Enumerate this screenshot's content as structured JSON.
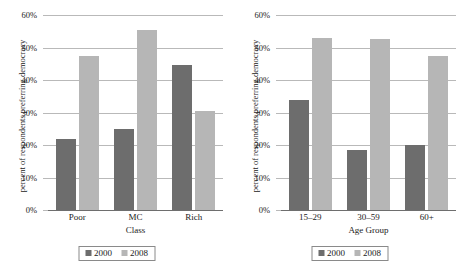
{
  "figure": {
    "clipped_header_text": "",
    "series_colors": {
      "s2000": "#6d6d6d",
      "s2008": "#b6b6b6"
    },
    "gridline_color": "#b9b9b9",
    "axis_color": "#6e6e6e"
  },
  "chart_data": [
    {
      "type": "bar",
      "title": "",
      "xlabel": "Class",
      "ylabel": "percent of respondents preferring democracy",
      "categories": [
        "Poor",
        "MC",
        "Rich"
      ],
      "series": [
        {
          "name": "2000",
          "values": [
            22,
            25,
            44.5
          ],
          "color": "#6d6d6d"
        },
        {
          "name": "2008",
          "values": [
            47.5,
            55.5,
            30.5
          ],
          "color": "#b6b6b6"
        }
      ],
      "ylim": [
        0,
        60
      ],
      "yticks": [
        0,
        10,
        20,
        30,
        40,
        50,
        60
      ],
      "ytick_labels": [
        "0%",
        "10%",
        "20%",
        "30%",
        "40%",
        "50%",
        "60%"
      ],
      "grid": true,
      "legend": [
        "2000",
        "2008"
      ],
      "legend_position": "bottom"
    },
    {
      "type": "bar",
      "title": "",
      "xlabel": "Age Group",
      "ylabel": "percent of respondents preferring democracy",
      "categories": [
        "15–29",
        "30–59",
        "60+"
      ],
      "series": [
        {
          "name": "2000",
          "values": [
            34,
            18.5,
            20
          ],
          "color": "#6d6d6d"
        },
        {
          "name": "2008",
          "values": [
            53,
            52.5,
            47.5
          ],
          "color": "#b6b6b6"
        }
      ],
      "ylim": [
        0,
        60
      ],
      "yticks": [
        0,
        10,
        20,
        30,
        40,
        50,
        60
      ],
      "ytick_labels": [
        "0%",
        "10%",
        "20%",
        "30%",
        "40%",
        "50%",
        "60%"
      ],
      "grid": true,
      "legend": [
        "2000",
        "2008"
      ],
      "legend_position": "bottom"
    }
  ]
}
